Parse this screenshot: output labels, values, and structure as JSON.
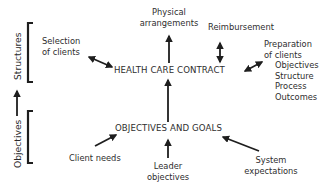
{
  "diagram": {
    "side_labels": {
      "structures": "Structures",
      "objectives": "Objectives"
    },
    "central_nodes": {
      "health_care_contract": "HEALTH CARE CONTRACT",
      "objectives_and_goals": "OBJECTIVES AND GOALS"
    },
    "contract_inputs": {
      "selection_of_clients": [
        "Selection",
        "of clients"
      ],
      "physical_arrangements": [
        "Physical",
        "arrangements"
      ],
      "reimbursement": "Reimbursement",
      "preparation_of_clients": {
        "title": [
          "Preparation",
          "of clients"
        ],
        "items": [
          "Objectives",
          "Structure",
          "Process",
          "Outcomes"
        ]
      }
    },
    "goal_inputs": {
      "client_needs": "Client needs",
      "leader_objectives": [
        "Leader",
        "objectives"
      ],
      "system_expectations": [
        "System",
        "expectations"
      ]
    },
    "edges": [
      {
        "from": "Selection of clients",
        "to": "HEALTH CARE CONTRACT",
        "type": "bidirectional"
      },
      {
        "from": "HEALTH CARE CONTRACT",
        "to": "Physical arrangements",
        "type": "directed"
      },
      {
        "from": "Reimbursement",
        "to": "HEALTH CARE CONTRACT",
        "type": "bidirectional"
      },
      {
        "from": "Preparation of clients",
        "to": "HEALTH CARE CONTRACT",
        "type": "bidirectional"
      },
      {
        "from": "OBJECTIVES AND GOALS",
        "to": "HEALTH CARE CONTRACT",
        "type": "directed"
      },
      {
        "from": "Client needs",
        "to": "OBJECTIVES AND GOALS",
        "type": "directed"
      },
      {
        "from": "Leader objectives",
        "to": "OBJECTIVES AND GOALS",
        "type": "directed"
      },
      {
        "from": "System expectations",
        "to": "OBJECTIVES AND GOALS",
        "type": "directed"
      },
      {
        "from": "Objectives",
        "to": "Structures",
        "type": "directed"
      }
    ],
    "colors": {
      "ink": "#1e1e1e",
      "background": "#ffffff"
    }
  }
}
